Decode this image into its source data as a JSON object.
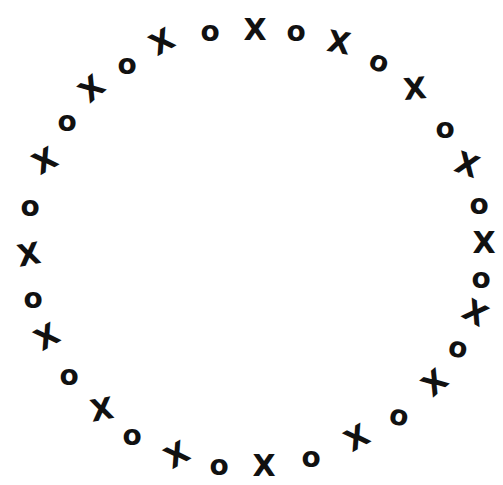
{
  "illustration": {
    "description": "Hand-drawn ring of alternating X and O marks on white background",
    "ink_color": "#111111",
    "background": "#ffffff",
    "glyphs": [
      {
        "c": "X",
        "x": 255,
        "y": 30,
        "r": 0
      },
      {
        "c": "O",
        "x": 296,
        "y": 32,
        "r": 0
      },
      {
        "c": "X",
        "x": 339,
        "y": 43,
        "r": 10
      },
      {
        "c": "O",
        "x": 379,
        "y": 62,
        "r": 20
      },
      {
        "c": "X",
        "x": 415,
        "y": 89,
        "r": -5
      },
      {
        "c": "O",
        "x": 445,
        "y": 129,
        "r": 0
      },
      {
        "c": "X",
        "x": 467,
        "y": 165,
        "r": 20
      },
      {
        "c": "O",
        "x": 479,
        "y": 205,
        "r": 0
      },
      {
        "c": "X",
        "x": 484,
        "y": 243,
        "r": 0
      },
      {
        "c": "O",
        "x": 481,
        "y": 279,
        "r": 0
      },
      {
        "c": "X",
        "x": 475,
        "y": 313,
        "r": 30
      },
      {
        "c": "O",
        "x": 458,
        "y": 348,
        "r": 10
      },
      {
        "c": "X",
        "x": 435,
        "y": 383,
        "r": -40
      },
      {
        "c": "O",
        "x": 399,
        "y": 416,
        "r": 10
      },
      {
        "c": "X",
        "x": 357,
        "y": 438,
        "r": -30
      },
      {
        "c": "O",
        "x": 311,
        "y": 458,
        "r": 0
      },
      {
        "c": "X",
        "x": 264,
        "y": 466,
        "r": 0
      },
      {
        "c": "O",
        "x": 219,
        "y": 466,
        "r": 0
      },
      {
        "c": "X",
        "x": 177,
        "y": 455,
        "r": -30
      },
      {
        "c": "O",
        "x": 132,
        "y": 436,
        "r": 0
      },
      {
        "c": "X",
        "x": 102,
        "y": 410,
        "r": -10
      },
      {
        "c": "O",
        "x": 69,
        "y": 376,
        "r": 0
      },
      {
        "c": "X",
        "x": 47,
        "y": 337,
        "r": -30
      },
      {
        "c": "O",
        "x": 33,
        "y": 299,
        "r": 0
      },
      {
        "c": "X",
        "x": 29,
        "y": 255,
        "r": -10
      },
      {
        "c": "O",
        "x": 30,
        "y": 207,
        "r": 0
      },
      {
        "c": "X",
        "x": 45,
        "y": 161,
        "r": -30
      },
      {
        "c": "O",
        "x": 67,
        "y": 122,
        "r": 0
      },
      {
        "c": "X",
        "x": 92,
        "y": 89,
        "r": -40
      },
      {
        "c": "O",
        "x": 127,
        "y": 65,
        "r": 0
      },
      {
        "c": "X",
        "x": 162,
        "y": 42,
        "r": -30
      },
      {
        "c": "O",
        "x": 210,
        "y": 32,
        "r": 0
      }
    ]
  }
}
